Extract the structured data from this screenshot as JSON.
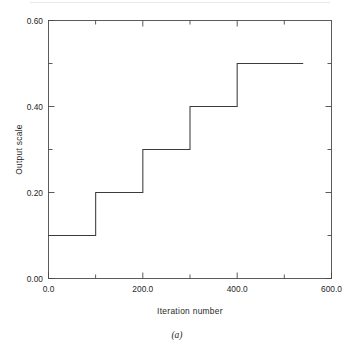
{
  "figure": {
    "caption": "(a)"
  },
  "chart_data": {
    "type": "line",
    "subtype": "step",
    "title": "",
    "xlabel": "Iteration number",
    "ylabel": "Output scale",
    "xlim": [
      0.0,
      600.0
    ],
    "ylim": [
      0.0,
      0.6
    ],
    "grid": false,
    "legend": null,
    "x_ticks_major": [
      "0.0",
      "200.0",
      "400.0",
      "600.0"
    ],
    "x_tick_values_major": [
      0,
      200,
      400,
      600
    ],
    "x_tick_values_minor": [
      100,
      300,
      500
    ],
    "y_ticks_major": [
      "0.00",
      "0.20",
      "0.40",
      "0.60"
    ],
    "y_tick_values_major": [
      0.0,
      0.2,
      0.4,
      0.6
    ],
    "y_tick_values_minor": [
      0.1,
      0.3,
      0.5
    ],
    "series": [
      {
        "name": "Output scale",
        "x": [
          0,
          100,
          100,
          200,
          200,
          300,
          300,
          400,
          400,
          540
        ],
        "y": [
          0.1,
          0.1,
          0.2,
          0.2,
          0.3,
          0.3,
          0.4,
          0.4,
          0.5,
          0.5
        ]
      }
    ],
    "steps": [
      {
        "x_start": 0,
        "x_end": 100,
        "value": 0.1
      },
      {
        "x_start": 100,
        "x_end": 200,
        "value": 0.2
      },
      {
        "x_start": 200,
        "x_end": 300,
        "value": 0.3
      },
      {
        "x_start": 300,
        "x_end": 400,
        "value": 0.4
      },
      {
        "x_start": 400,
        "x_end": 540,
        "value": 0.5
      }
    ]
  }
}
